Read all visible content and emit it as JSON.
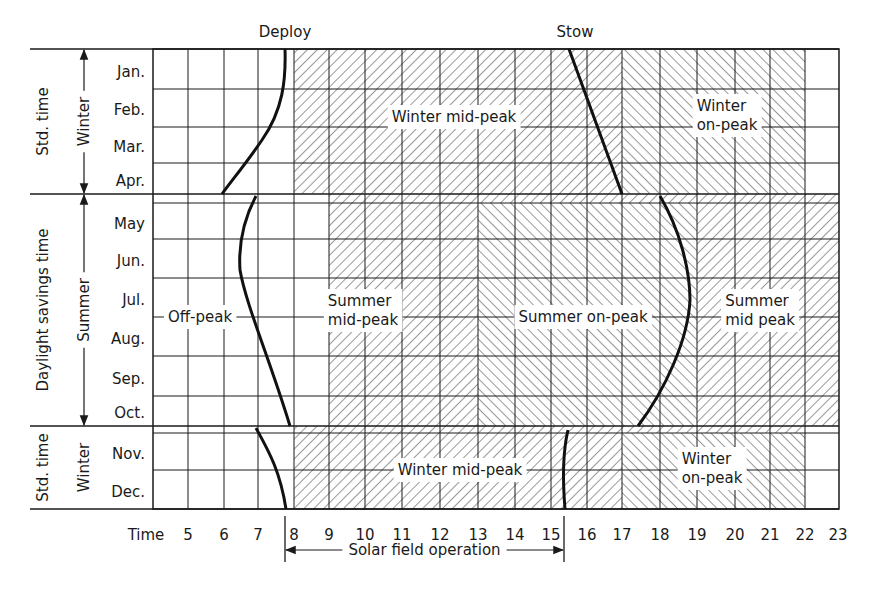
{
  "header": {
    "deploy_label": "Deploy",
    "stow_label": "Stow"
  },
  "left_axis": {
    "outer_labels": [
      {
        "text": "Std. time",
        "y0": 49,
        "y1": 194
      },
      {
        "text": "Daylight savings time",
        "y0": 194,
        "y1": 426
      },
      {
        "text": "Std. time",
        "y0": 426,
        "y1": 509
      }
    ],
    "season_labels": [
      {
        "text": "Winter",
        "y0": 49,
        "y1": 194,
        "arrows": true
      },
      {
        "text": "Summer",
        "y0": 194,
        "y1": 426,
        "arrows": true
      },
      {
        "text": "Winter",
        "y0": 426,
        "y1": 509,
        "arrows": false
      }
    ],
    "months": [
      {
        "text": "Jan.",
        "y": 72
      },
      {
        "text": "Feb.",
        "y": 110
      },
      {
        "text": "Mar.",
        "y": 147
      },
      {
        "text": "Apr.",
        "y": 181
      },
      {
        "text": "May",
        "y": 224
      },
      {
        "text": "Jun.",
        "y": 261
      },
      {
        "text": "Jul.",
        "y": 300
      },
      {
        "text": "Aug.",
        "y": 339
      },
      {
        "text": "Sep.",
        "y": 379
      },
      {
        "text": "Oct.",
        "y": 413
      },
      {
        "text": "Nov.",
        "y": 454
      },
      {
        "text": "Dec.",
        "y": 492
      }
    ]
  },
  "time_axis": {
    "label": "Time",
    "ticks": [
      "5",
      "6",
      "7",
      "8",
      "9",
      "10",
      "11",
      "12",
      "13",
      "14",
      "15",
      "16",
      "17",
      "18",
      "19",
      "20",
      "21",
      "22",
      "23"
    ],
    "tick_x": [
      188,
      224,
      258,
      294,
      329,
      365,
      402,
      440,
      478,
      515,
      551,
      587,
      622,
      660,
      697,
      735,
      770,
      805,
      838
    ]
  },
  "grid": {
    "left": 153,
    "right": 839,
    "top": 49,
    "bottom": 509,
    "col_x": [
      188,
      224,
      258,
      294,
      329,
      365,
      402,
      440,
      478,
      515,
      551,
      587,
      622,
      660,
      697,
      735,
      770,
      805
    ],
    "row_y": [
      89,
      127,
      163,
      203,
      239,
      278,
      317,
      356,
      396,
      433,
      470
    ],
    "season_boundaries_y": [
      194,
      426
    ]
  },
  "regions": [
    {
      "name": "winter-mid-peak-top",
      "x0": 294,
      "x1": 622,
      "y0": 49,
      "y1": 194,
      "hatch": "back"
    },
    {
      "name": "winter-on-peak-top",
      "x0": 622,
      "x1": 805,
      "y0": 49,
      "y1": 194,
      "hatch": "fwd"
    },
    {
      "name": "transition-strip-spring",
      "x0": 329,
      "x1": 839,
      "y0": 194,
      "y1": 203,
      "hatch": "back"
    },
    {
      "name": "summer-mid-peak-left",
      "x0": 329,
      "x1": 478,
      "y0": 203,
      "y1": 426,
      "hatch": "back"
    },
    {
      "name": "summer-on-peak",
      "x0": 478,
      "x1": 697,
      "y0": 203,
      "y1": 426,
      "hatch": "fwd"
    },
    {
      "name": "summer-mid-peak-right",
      "x0": 697,
      "x1": 839,
      "y0": 203,
      "y1": 426,
      "hatch": "back"
    },
    {
      "name": "transition-strip-fall",
      "x0": 294,
      "x1": 805,
      "y0": 426,
      "y1": 433,
      "hatch": "back"
    },
    {
      "name": "winter-mid-peak-bottom",
      "x0": 294,
      "x1": 622,
      "y0": 433,
      "y1": 509,
      "hatch": "back"
    },
    {
      "name": "winter-on-peak-bottom",
      "x0": 622,
      "x1": 805,
      "y0": 433,
      "y1": 509,
      "hatch": "fwd"
    }
  ],
  "region_labels": [
    {
      "lines": [
        "Winter mid-peak"
      ],
      "x": 454,
      "y": 122
    },
    {
      "lines": [
        "Winter",
        "on-peak"
      ],
      "x": 727,
      "y": 111
    },
    {
      "lines": [
        "Off-peak"
      ],
      "x": 200,
      "y": 322
    },
    {
      "lines": [
        "Summer",
        "mid-peak"
      ],
      "x": 363,
      "y": 306
    },
    {
      "lines": [
        "Summer on-peak"
      ],
      "x": 583,
      "y": 322
    },
    {
      "lines": [
        "Summer",
        "mid peak"
      ],
      "x": 760,
      "y": 306
    },
    {
      "lines": [
        "Winter mid-peak"
      ],
      "x": 460,
      "y": 475
    },
    {
      "lines": [
        "Winter",
        "on-peak"
      ],
      "x": 712,
      "y": 464
    }
  ],
  "curves": {
    "deploy": [
      "M285,49 C286,80 283,110 262,140 C245,165 232,180 222,194",
      "M256,196 C246,215 238,240 240,270 C246,305 270,360 290,426",
      "M256,428 C268,450 280,470 286,509"
    ],
    "stow": [
      "M569,49 L622,194",
      "M660,196 C680,230 690,270 690,300 C688,340 665,390 638,426",
      "M568,430 C562,455 563,485 565,509"
    ]
  },
  "solar_field": {
    "label": "Solar field operation",
    "x0": 285,
    "x1": 564,
    "y": 550
  },
  "colors": {
    "ink": "#1a1a1a",
    "background": "#ffffff"
  }
}
